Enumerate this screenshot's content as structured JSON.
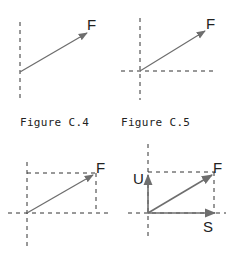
{
  "figures": [
    {
      "id": "C.4",
      "caption": "Figure C.4",
      "vector_label": "F"
    },
    {
      "id": "C.5",
      "caption": "Figure C.5",
      "vector_label": "F"
    },
    {
      "id": "C.6",
      "caption": "",
      "vector_label": "F"
    },
    {
      "id": "C.7",
      "caption": "",
      "vector_label": "F",
      "component_labels": {
        "vertical": "U",
        "horizontal": "S"
      }
    }
  ],
  "colors": {
    "arrow": "#6e6e6e",
    "dashed": "#333333",
    "text": "#222222"
  }
}
